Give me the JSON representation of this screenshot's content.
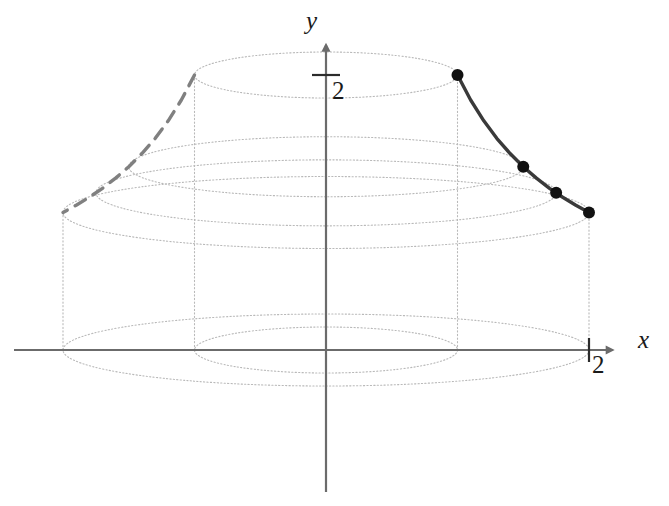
{
  "figure": {
    "background_color": "#ffffff"
  },
  "axes": {
    "x_label": "x",
    "y_label": "y",
    "x_tick_label": "2",
    "y_tick_label": "2",
    "axis_color": "#6b6b6b",
    "origin_px": {
      "x": 326,
      "y": 350
    },
    "x_unit_px": 131.5,
    "y_unit_px": 137.5,
    "x_range": [
      -2.0,
      2.3
    ],
    "y_range": [
      -1.15,
      2.15
    ],
    "arrows": [
      "x-positive",
      "y-positive"
    ]
  },
  "chart_data": {
    "type": "line",
    "xlabel": "x",
    "ylabel": "y",
    "xlim": [
      -2.0,
      2.3
    ],
    "ylim": [
      -1.15,
      2.15
    ],
    "grid": false,
    "function": "y = 2/x",
    "series": [
      {
        "name": "generating-curve",
        "style": "solid",
        "color": "#3a3a3a",
        "linewidth": 3.4,
        "x": [
          1.0,
          1.1,
          1.2,
          1.3,
          1.4,
          1.5,
          1.6,
          1.7,
          1.8,
          1.9,
          2.0
        ],
        "y": [
          2.0,
          1.818,
          1.667,
          1.538,
          1.429,
          1.333,
          1.25,
          1.176,
          1.111,
          1.053,
          1.0
        ]
      },
      {
        "name": "mirrored-curve",
        "style": "dashed",
        "color": "#808080",
        "linewidth": 3.4,
        "x": [
          -1.0,
          -1.1,
          -1.2,
          -1.3,
          -1.4,
          -1.5,
          -1.6,
          -1.7,
          -1.8,
          -1.9,
          -2.0
        ],
        "y": [
          2.0,
          1.818,
          1.667,
          1.538,
          1.429,
          1.333,
          1.25,
          1.176,
          1.111,
          1.053,
          1.0
        ]
      }
    ],
    "markers": {
      "name": "sample-points",
      "color": "#111111",
      "radius_px": 6,
      "points": [
        {
          "x": 1.0,
          "y": 2.0
        },
        {
          "x": 1.5,
          "y": 1.333
        },
        {
          "x": 1.75,
          "y": 1.143
        },
        {
          "x": 2.0,
          "y": 1.0
        }
      ]
    },
    "revolution_ellipses": [
      {
        "name": "top-rim",
        "radius_x": 1.0,
        "center_y": 2.0,
        "radius_y_px": 23
      },
      {
        "name": "mid-upper-rim",
        "radius_x": 1.5,
        "center_y": 1.333,
        "radius_y_px": 30
      },
      {
        "name": "mid-lower-rim",
        "radius_x": 1.75,
        "center_y": 1.143,
        "radius_y_px": 33
      },
      {
        "name": "outer-rim",
        "radius_x": 2.0,
        "center_y": 1.0,
        "radius_y_px": 36
      },
      {
        "name": "base-outer",
        "radius_x": 2.0,
        "center_y": 0.0,
        "radius_y_px": 36
      },
      {
        "name": "base-inner",
        "radius_x": 1.0,
        "center_y": 0.0,
        "radius_y_px": 23
      }
    ],
    "vertical_connectors": [
      {
        "x": -2.0,
        "y_from": 0.0,
        "y_to": 1.0
      },
      {
        "x": -1.0,
        "y_from": 0.0,
        "y_to": 2.0
      },
      {
        "x": 1.0,
        "y_from": 0.0,
        "y_to": 2.0
      },
      {
        "x": 2.0,
        "y_from": 0.0,
        "y_to": 1.0
      }
    ],
    "guide_color": "#b9b9b9",
    "annotations": []
  }
}
